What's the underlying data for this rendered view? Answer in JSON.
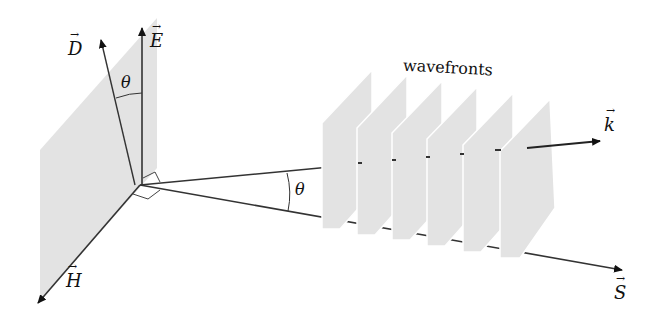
{
  "diagram": {
    "title_label": "wavefronts",
    "vectors": {
      "D": "D",
      "E": "E",
      "H": "H",
      "k": "k",
      "S": "S"
    },
    "angle_labels": {
      "theta_top": "θ",
      "theta_mid": "θ"
    },
    "wavefront_count": 6,
    "colors": {
      "plane_fill": "#e3e3e3",
      "line": "#333333",
      "background": "#ffffff"
    }
  }
}
